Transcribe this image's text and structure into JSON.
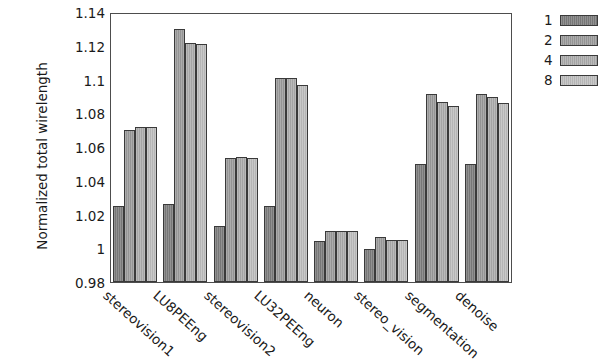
{
  "chart_data": {
    "type": "bar",
    "title": "",
    "subtitle": "",
    "xlabel": "",
    "ylabel": "Normalized total wirelength",
    "ylim": [
      0.98,
      1.14
    ],
    "ytick_labels": [
      "1.14",
      "1.12",
      "1.1",
      "1.08",
      "1.06",
      "1.04",
      "1.02",
      "1",
      "0.98"
    ],
    "ytick_values": [
      1.14,
      1.12,
      1.1,
      1.08,
      1.06,
      1.04,
      1.02,
      1.0,
      0.98
    ],
    "grid": false,
    "legend_position": "right-top",
    "categories": [
      "stereovision1",
      "LU8PEEng",
      "stereovision2",
      "LU32PEEng",
      "neuron",
      "stereo_vision",
      "segmentation",
      "denoise"
    ],
    "series": [
      {
        "name": "1",
        "color": "#7d7d7d",
        "values": [
          1.025,
          1.026,
          1.013,
          1.025,
          1.0045,
          0.9995,
          1.05,
          1.05
        ]
      },
      {
        "name": "2",
        "color": "#9c9c9c",
        "values": [
          1.07,
          1.13,
          1.0535,
          1.101,
          1.01,
          1.0065,
          1.0915,
          1.0915
        ]
      },
      {
        "name": "4",
        "color": "#adadad",
        "values": [
          1.072,
          1.1215,
          1.054,
          1.101,
          1.01,
          1.005,
          1.0865,
          1.0895
        ]
      },
      {
        "name": "8",
        "color": "#bfbfbf",
        "values": [
          1.072,
          1.121,
          1.0535,
          1.0965,
          1.01,
          1.005,
          1.0845,
          1.086
        ]
      }
    ]
  }
}
